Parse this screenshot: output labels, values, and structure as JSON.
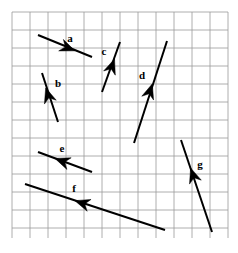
{
  "figure": {
    "background_color": "#ffffff",
    "grid": {
      "color": "#9a9a9a",
      "line_width": 0.8,
      "cell_size": 18,
      "x0": 12,
      "y0": 12,
      "x1": 228,
      "y1": 238,
      "cols": 12,
      "rows": 12.5,
      "visible": true
    },
    "vector_color": "#000000",
    "vector_line_width": 2.0
  },
  "chart_data": {
    "type": "scatter",
    "xlabel": "",
    "ylabel": "",
    "xlim": [
      12,
      228
    ],
    "ylim": [
      12,
      238
    ],
    "grid": true,
    "legend": "none",
    "units": "grid squares (18 px each)",
    "vectors": [
      {
        "name": "a",
        "label": "a",
        "tail": [
          38,
          35
        ],
        "head": [
          92,
          57
        ],
        "arrowhead_at": [
          68,
          48
        ],
        "direction": "right-down",
        "label_pos": [
          70,
          42
        ],
        "dx_cells": 3.0,
        "dy_cells": 1.22
      },
      {
        "name": "b",
        "label": "b",
        "tail": [
          58,
          122
        ],
        "head": [
          42,
          73
        ],
        "arrowhead_at": [
          48,
          95
        ],
        "direction": "up-left",
        "label_pos": [
          58,
          87
        ],
        "dx_cells": -0.89,
        "dy_cells": -2.72
      },
      {
        "name": "c",
        "label": "c",
        "tail": [
          102,
          92
        ],
        "head": [
          120,
          42
        ],
        "arrowhead_at": [
          112,
          66
        ],
        "direction": "up-right",
        "label_pos": [
          104,
          55
        ],
        "dx_cells": 1.0,
        "dy_cells": -2.78
      },
      {
        "name": "d",
        "label": "d",
        "tail": [
          134,
          143
        ],
        "head": [
          167,
          41
        ],
        "arrowhead_at": [
          150,
          91
        ],
        "direction": "up-right",
        "label_pos": [
          142,
          79
        ],
        "dx_cells": 1.83,
        "dy_cells": -5.67
      },
      {
        "name": "e",
        "label": "e",
        "tail": [
          92,
          172
        ],
        "head": [
          38,
          152
        ],
        "arrowhead_at": [
          62,
          161
        ],
        "direction": "left-up",
        "label_pos": [
          62,
          152
        ],
        "dx_cells": -3.0,
        "dy_cells": -1.11
      },
      {
        "name": "f",
        "label": "f",
        "tail": [
          165,
          230
        ],
        "head": [
          25,
          184
        ],
        "arrowhead_at": [
          82,
          203
        ],
        "direction": "left-up",
        "label_pos": [
          74,
          192
        ],
        "dx_cells": -7.78,
        "dy_cells": -2.56
      },
      {
        "name": "g",
        "label": "g",
        "tail": [
          212,
          232
        ],
        "head": [
          181,
          140
        ],
        "arrowhead_at": [
          193,
          175
        ],
        "direction": "up-left",
        "label_pos": [
          200,
          168
        ],
        "dx_cells": -1.72,
        "dy_cells": -5.11
      }
    ]
  }
}
